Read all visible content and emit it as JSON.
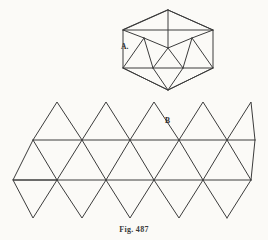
{
  "figure": {
    "caption": "Fig. 487",
    "stroke_color": "#3c3c3c",
    "background_color": "#fbfaf7",
    "labels": [
      {
        "id": "A",
        "text": "A.",
        "x": 121,
        "y": 43,
        "refers_to": "icosahedron-solid"
      },
      {
        "id": "B",
        "text": "B",
        "x": 165,
        "y": 117,
        "refers_to": "icosahedron-net"
      }
    ]
  },
  "solid": {
    "name": "icosahedron-solid",
    "description": "Icosahedron drawn in perspective, hexagonal outline with pentagonal antiprism interior",
    "outline": [
      [
        168,
        10
      ],
      [
        213,
        30
      ],
      [
        213,
        68
      ],
      [
        168,
        90
      ],
      [
        123,
        68
      ],
      [
        123,
        30
      ]
    ],
    "upper_ring": [
      [
        144,
        38
      ],
      [
        168,
        48
      ],
      [
        192,
        38
      ],
      [
        183,
        68
      ],
      [
        153,
        68
      ]
    ],
    "edges_apex_top": [
      [
        [
          168,
          10
        ],
        [
          123,
          30
        ]
      ],
      [
        [
          168,
          10
        ],
        [
          213,
          30
        ]
      ],
      [
        [
          168,
          10
        ],
        [
          168,
          48
        ]
      ]
    ],
    "edges_apex_bottom": [
      [
        [
          168,
          90
        ],
        [
          123,
          68
        ]
      ],
      [
        [
          168,
          90
        ],
        [
          213,
          68
        ]
      ],
      [
        [
          168,
          90
        ],
        [
          153,
          68
        ]
      ],
      [
        [
          168,
          90
        ],
        [
          183,
          68
        ]
      ]
    ],
    "horizontal_rules": [
      [
        [
          123,
          30
        ],
        [
          213,
          30
        ]
      ],
      [
        [
          123,
          68
        ],
        [
          213,
          68
        ]
      ]
    ],
    "interior_edges": [
      [
        [
          123,
          30
        ],
        [
          144,
          38
        ]
      ],
      [
        [
          213,
          30
        ],
        [
          192,
          38
        ]
      ],
      [
        [
          144,
          38
        ],
        [
          168,
          48
        ]
      ],
      [
        [
          192,
          38
        ],
        [
          168,
          48
        ]
      ],
      [
        [
          144,
          38
        ],
        [
          153,
          68
        ]
      ],
      [
        [
          192,
          38
        ],
        [
          183,
          68
        ]
      ],
      [
        [
          168,
          48
        ],
        [
          153,
          68
        ]
      ],
      [
        [
          168,
          48
        ],
        [
          183,
          68
        ]
      ],
      [
        [
          123,
          68
        ],
        [
          144,
          38
        ]
      ],
      [
        [
          213,
          68
        ],
        [
          192,
          38
        ]
      ]
    ]
  },
  "net": {
    "name": "icosahedron-net",
    "description": "Planar net of the icosahedron: a strip of 20 triangles arranged in an antiprism band with a row of triangles above and below",
    "triangle_count": 20,
    "columns": 5,
    "geometry": {
      "left_x": 13,
      "step_x": 48.5,
      "half_step_x": 24.25,
      "top_y": 102,
      "upper_line_y": 140,
      "lower_line_y": 180,
      "bottom_y": 218
    },
    "top_apices": [
      [
        57,
        102
      ],
      [
        106,
        102
      ],
      [
        154,
        102
      ],
      [
        203,
        102
      ],
      [
        251,
        102
      ]
    ],
    "upper_row_vertices": [
      [
        33,
        140
      ],
      [
        82,
        140
      ],
      [
        130,
        140
      ],
      [
        179,
        140
      ],
      [
        227,
        140
      ]
    ],
    "lower_row_vertices": [
      [
        13,
        180
      ],
      [
        57,
        180
      ],
      [
        106,
        180
      ],
      [
        154,
        180
      ],
      [
        203,
        180
      ],
      [
        251,
        180
      ]
    ],
    "bottom_apices": [
      [
        33,
        218
      ],
      [
        82,
        218
      ],
      [
        130,
        218
      ],
      [
        179,
        218
      ]
    ],
    "horizontal_rules": [
      [
        [
          33,
          140
        ],
        [
          255,
          140
        ]
      ],
      [
        [
          13,
          180
        ],
        [
          251,
          180
        ]
      ]
    ]
  }
}
